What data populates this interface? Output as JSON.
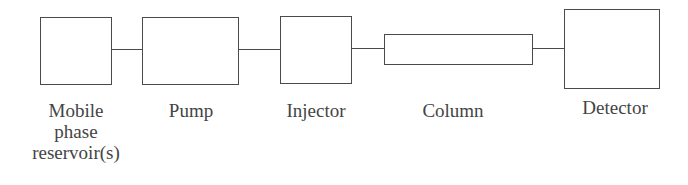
{
  "diagram": {
    "type": "block-flow",
    "stroke_color": "#4a4a4a",
    "text_color": "#444444",
    "components": [
      {
        "id": "reservoir",
        "label": "Mobile\nphase\nreservoir(s)"
      },
      {
        "id": "pump",
        "label": "Pump"
      },
      {
        "id": "injector",
        "label": "Injector"
      },
      {
        "id": "column",
        "label": "Column"
      },
      {
        "id": "detector",
        "label": "Detector"
      }
    ],
    "connections": [
      {
        "from": "reservoir",
        "to": "pump"
      },
      {
        "from": "pump",
        "to": "injector"
      },
      {
        "from": "injector",
        "to": "column"
      },
      {
        "from": "column",
        "to": "detector"
      }
    ]
  }
}
